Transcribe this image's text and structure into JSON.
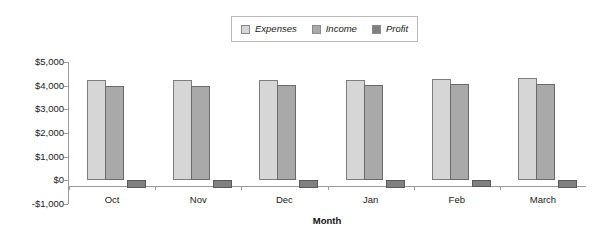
{
  "chart_data": {
    "type": "bar",
    "title": "",
    "xlabel": "Month",
    "ylabel": "",
    "categories": [
      "Oct",
      "Nov",
      "Dec",
      "Jan",
      "Feb",
      "March"
    ],
    "series": [
      {
        "name": "Expenses",
        "color": "#d6d6d6",
        "values": [
          4250,
          4250,
          4250,
          4250,
          4280,
          4320
        ]
      },
      {
        "name": "Income",
        "color": "#a9a9a9",
        "values": [
          4000,
          4000,
          4010,
          4010,
          4050,
          4070
        ]
      },
      {
        "name": "Profit",
        "color": "#808080",
        "values": [
          -330,
          -330,
          -330,
          -330,
          -290,
          -330
        ]
      }
    ],
    "ylim": [
      -1000,
      5000
    ],
    "ytick_labels": [
      "$5,000",
      "$4,000",
      "$3,000",
      "$2,000",
      "$1,000",
      "$0",
      "-$1,000"
    ],
    "ytick_values": [
      5000,
      4000,
      3000,
      2000,
      1000,
      0,
      -1000
    ],
    "grid": false,
    "legend_position": "top-center",
    "legend_entries": [
      "Expenses",
      "Income",
      "Profit"
    ]
  }
}
